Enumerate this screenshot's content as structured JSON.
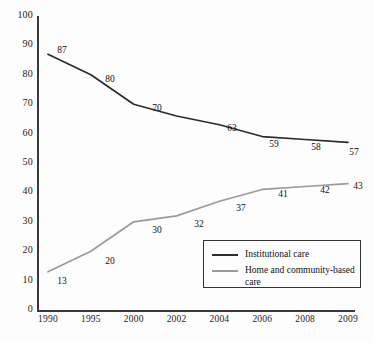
{
  "chart_data": {
    "type": "line",
    "title": "",
    "subtitle": "",
    "xlabel": "",
    "ylabel": "",
    "categories": [
      "1990",
      "1995",
      "2000",
      "2002",
      "2004",
      "2006",
      "2008",
      "2009"
    ],
    "ylim": [
      0,
      100
    ],
    "y_ticks": [
      "0",
      "10",
      "20",
      "30",
      "40",
      "50",
      "60",
      "70",
      "80",
      "90",
      "100"
    ],
    "grid": false,
    "legend_position": "inside-lower-right",
    "series": [
      {
        "name": "Institutional care",
        "color": "#2b2b2b",
        "values": [
          87,
          80,
          70,
          66,
          63,
          59,
          58,
          57
        ],
        "labels": [
          "87",
          "80",
          "70",
          "",
          "63",
          "59",
          "58",
          "57"
        ]
      },
      {
        "name": "Home and community-based care",
        "color": "#9a9a9a",
        "values": [
          13,
          20,
          30,
          32,
          37,
          41,
          42,
          43
        ],
        "labels": [
          "13",
          "20",
          "30",
          "32",
          "37",
          "41",
          "42",
          "43"
        ]
      }
    ]
  },
  "legend": {
    "entries": [
      {
        "label": "Institutional care",
        "color": "#2b2b2b"
      },
      {
        "label": "Home and community-based care",
        "color": "#9a9a9a"
      }
    ]
  },
  "axes": {
    "y_tick_labels": [
      "100",
      "90",
      "80",
      "70",
      "60",
      "50",
      "40",
      "30",
      "20",
      "10",
      "0"
    ],
    "x_tick_labels": [
      "1990",
      "1995",
      "2000",
      "2002",
      "2004",
      "2006",
      "2008",
      "2009"
    ]
  },
  "point_labels": {
    "institutional": [
      {
        "text": "87",
        "x": 62,
        "y": 50
      },
      {
        "text": "80",
        "x": 110,
        "y": 79
      },
      {
        "text": "70",
        "x": 157,
        "y": 108
      },
      {
        "text": "63",
        "x": 232,
        "y": 128
      },
      {
        "text": "59",
        "x": 274,
        "y": 144
      },
      {
        "text": "58",
        "x": 316,
        "y": 147
      },
      {
        "text": "57",
        "x": 354,
        "y": 152
      }
    ],
    "home": [
      {
        "text": "13",
        "x": 62,
        "y": 281
      },
      {
        "text": "20",
        "x": 110,
        "y": 261
      },
      {
        "text": "30",
        "x": 157,
        "y": 230
      },
      {
        "text": "32",
        "x": 199,
        "y": 224
      },
      {
        "text": "37",
        "x": 241,
        "y": 208
      },
      {
        "text": "41",
        "x": 283,
        "y": 194
      },
      {
        "text": "42",
        "x": 325,
        "y": 190
      },
      {
        "text": "43",
        "x": 358,
        "y": 186
      }
    ]
  },
  "colors": {
    "background": "#fdfdfd",
    "axis": "#3a3a3a",
    "text": "#111111",
    "series_dark": "#2b2b2b",
    "series_light": "#9a9a9a",
    "legend_border": "#333333"
  }
}
